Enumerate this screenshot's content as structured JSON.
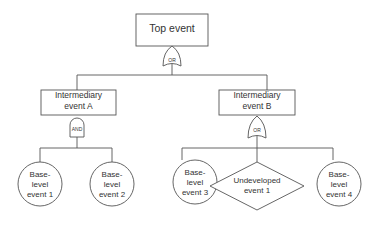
{
  "diagram": {
    "type": "fault-tree",
    "stroke_color": "#555555",
    "text_color": "#333333",
    "top_event": {
      "label": "Top event",
      "gate": "OR"
    },
    "intermediate_events": [
      {
        "label_line1": "Intermediary",
        "label_line2": "event A",
        "gate": "AND"
      },
      {
        "label_line1": "Intermediary",
        "label_line2": "event B",
        "gate": "OR"
      }
    ],
    "leaf_events": [
      {
        "shape": "circle",
        "line1": "Base-",
        "line2": "level",
        "line3": "event 1",
        "parent": "Intermediary event A"
      },
      {
        "shape": "circle",
        "line1": "Base-",
        "line2": "level",
        "line3": "event 2",
        "parent": "Intermediary event A"
      },
      {
        "shape": "circle",
        "line1": "Base-",
        "line2": "level",
        "line3": "event 3",
        "parent": "Intermediary event B"
      },
      {
        "shape": "diamond",
        "line1": "Undeveloped",
        "line2": "event 1",
        "parent": "Intermediary event B"
      },
      {
        "shape": "circle",
        "line1": "Base-",
        "line2": "level",
        "line3": "event 4",
        "parent": "Intermediary event B"
      }
    ]
  }
}
